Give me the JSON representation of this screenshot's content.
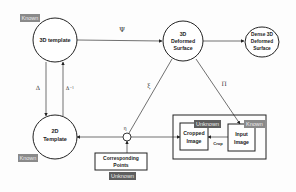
{
  "nodes": {
    "template_3d": {
      "label": "3D template",
      "badge": "Known"
    },
    "deformed_surface": {
      "line1": "3D",
      "line2": "Deformed",
      "line3": "Surface"
    },
    "dense_surface": {
      "line1": "Dense 3D",
      "line2": "Deformed",
      "line3": "Surface"
    },
    "template_2d": {
      "line1": "2D",
      "line2": "Template",
      "badge": "Known"
    },
    "corresponding_points": {
      "line1": "Corresponding",
      "line2": "Points",
      "badge": "Unknown"
    },
    "cropped_image": {
      "line1": "Cropped",
      "line2": "Image",
      "badge": "Unknown"
    },
    "input_image": {
      "line1": "Input",
      "line2": "Image",
      "badge": "Known"
    }
  },
  "edges": {
    "psi": "Ψ",
    "delta": "Δ",
    "delta_inv": "Δ⁻¹",
    "xi": "ξ",
    "pi": "Π",
    "eta": "η",
    "crop": "Crop"
  },
  "colors": {
    "badge": "#8a8a8a",
    "badge_dark": "#5e5e5e",
    "stroke": "#222222"
  }
}
